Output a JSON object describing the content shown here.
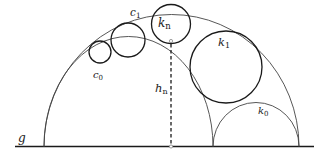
{
  "diagram": {
    "labels": {
      "baseline": "g",
      "outer_arc": "c",
      "outer_arc_sub": "1",
      "inner_arc": "c",
      "inner_arc_sub": "0",
      "circle_n": "k",
      "circle_n_sub": "n",
      "circle_1": "k",
      "circle_1_sub": "1",
      "circle_0": "k",
      "circle_0_sub": "0",
      "height": "h",
      "height_sub": "n"
    },
    "colors": {
      "stroke": "#1a1a1a",
      "arc": "#444444",
      "background": "#ffffff"
    }
  }
}
